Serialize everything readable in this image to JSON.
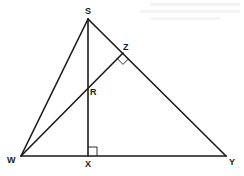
{
  "diagram": {
    "type": "geometry",
    "colors": {
      "line": "#1a1a1a",
      "background": "#ffffff"
    },
    "points": {
      "S": {
        "label": "S",
        "x": 88,
        "y": 19
      },
      "W": {
        "label": "W",
        "x": 21,
        "y": 156
      },
      "Y": {
        "label": "Y",
        "x": 226,
        "y": 156
      },
      "X": {
        "label": "X",
        "x": 88,
        "y": 156
      },
      "Z": {
        "label": "Z",
        "x": 123,
        "y": 53
      },
      "R": {
        "label": "R",
        "x": 88,
        "y": 87
      }
    },
    "segments": [
      "SW",
      "SY",
      "WY",
      "SX",
      "WZ"
    ],
    "right_angles": [
      "SXY",
      "WZY"
    ]
  }
}
